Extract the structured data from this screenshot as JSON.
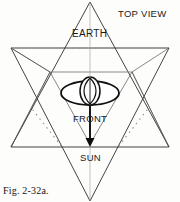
{
  "figure": {
    "caption": "Fig. 2-32a.",
    "view_label": "TOP VIEW",
    "labels": {
      "earth": "EARTH",
      "front": "FRONT",
      "sun": "SUN"
    },
    "colors": {
      "ink": "#1a1a1a",
      "line": "#3a3a3a",
      "light_line": "#8a8a8a",
      "paper": "#fdfdfc"
    },
    "geometry": {
      "type": "star-tetrahedron-top-view",
      "up_triangle": "90,2 11,147 169,147",
      "down_triangle": "90,200 11,48 169,48",
      "inner_horizontal": "50,72 132,72",
      "dotted_top": "62,48 120,48",
      "center_body": {
        "shape": "ellipse-with-circle-and-vesica",
        "cx": 90,
        "cy": 93,
        "rx": 28,
        "ry": 11
      },
      "arrow": "90,105 90,144"
    }
  }
}
